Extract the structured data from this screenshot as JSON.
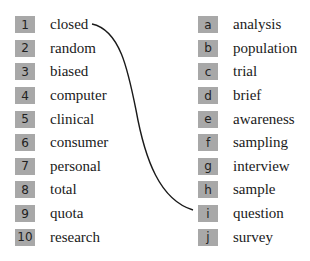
{
  "left_items": [
    {
      "key": "1",
      "word": "closed"
    },
    {
      "key": "2",
      "word": "random"
    },
    {
      "key": "3",
      "word": "biased"
    },
    {
      "key": "4",
      "word": "computer"
    },
    {
      "key": "5",
      "word": "clinical"
    },
    {
      "key": "6",
      "word": "consumer"
    },
    {
      "key": "7",
      "word": "personal"
    },
    {
      "key": "8",
      "word": "total"
    },
    {
      "key": "9",
      "word": "quota"
    },
    {
      "key": "10",
      "word": "research"
    }
  ],
  "right_items": [
    {
      "key": "a",
      "word": "analysis"
    },
    {
      "key": "b",
      "word": "population"
    },
    {
      "key": "c",
      "word": "trial"
    },
    {
      "key": "d",
      "word": "brief"
    },
    {
      "key": "e",
      "word": "awareness"
    },
    {
      "key": "f",
      "word": "sampling"
    },
    {
      "key": "g",
      "word": "interview"
    },
    {
      "key": "h",
      "word": "sample"
    },
    {
      "key": "i",
      "word": "question"
    },
    {
      "key": "j",
      "word": "survey"
    }
  ],
  "example_match": {
    "from": "1",
    "to": "i"
  },
  "colors": {
    "box": "#a8a8a8",
    "line": "#1a1a1a"
  }
}
